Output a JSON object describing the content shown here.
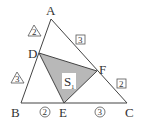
{
  "figure": {
    "vertices": {
      "A": "A",
      "B": "B",
      "C": "C",
      "D": "D",
      "E": "E",
      "F": "F"
    },
    "region_label": {
      "main": "S",
      "sub": "1"
    },
    "ratio_marks": {
      "AD": {
        "value": "2",
        "shape": "triangle"
      },
      "DB": {
        "value": "3",
        "shape": "triangle"
      },
      "AF": {
        "value": "3",
        "shape": "square"
      },
      "FC": {
        "value": "2",
        "shape": "square"
      },
      "BE": {
        "value": "2",
        "shape": "circle"
      },
      "EC": {
        "value": "3",
        "shape": "circle"
      }
    },
    "colors": {
      "shaded": "#b8b8b8",
      "line": "#444444"
    }
  }
}
